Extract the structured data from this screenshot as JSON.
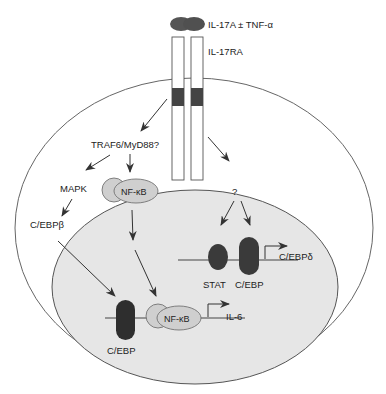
{
  "diagram": {
    "ligand": {
      "label": "IL-17A ± TNF-α",
      "color": "#555555"
    },
    "receptor": {
      "label": "IL-17RA",
      "band_color": "#444444"
    },
    "cytoplasm": {
      "adaptor": "TRAF6/MyD88?",
      "kinase": "MAPK",
      "tf_cytoplasm": "C/EBPβ",
      "nfkb_cytoplasm": "NF-κB",
      "unknown": "?"
    },
    "nucleus": {
      "fill": "#e6e6e6",
      "il6_promoter": {
        "cebp": "C/EBP",
        "nfkb": "NF-κB",
        "gene": "IL-6"
      },
      "cebpd_promoter": {
        "stat": "STAT",
        "cebp": "C/EBP",
        "gene": "C/EBPδ"
      }
    },
    "colors": {
      "dark_factor": "#3a3a3a",
      "nfkb_fill": "#cfcfcf",
      "outline": "#555555",
      "arrow": "#333333"
    }
  }
}
